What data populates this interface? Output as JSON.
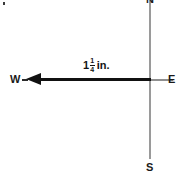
{
  "figure": {
    "width": 179,
    "height": 184,
    "background_color": "#ffffff",
    "type": "compass-vector-diagram",
    "ink_color": "#111111",
    "axis_color": "#9a9a9a"
  },
  "compass": {
    "north_label": "N",
    "south_label": "S",
    "east_label": "E",
    "west_label": "W"
  },
  "vector": {
    "direction_label": "W",
    "points_to": "west",
    "measurement": {
      "whole": "1",
      "numerator": "1",
      "denominator": "4",
      "unit": "in.",
      "full_text": "1 1/4 in."
    }
  },
  "chart_data": {
    "type": "scatter",
    "title": "",
    "xlabel": "",
    "ylabel": "",
    "annotations": [
      "1 1/4 in.",
      "N",
      "S",
      "E",
      "W"
    ],
    "axis_labels": {
      "up": "N",
      "down": "S",
      "right": "E",
      "left": "W"
    },
    "grid": false,
    "legend_position": "none",
    "series": [
      {
        "name": "displacement-vector",
        "origin": [
          150,
          80
        ],
        "tip": [
          30,
          80
        ],
        "magnitude": 1.25,
        "magnitude_unit": "in.",
        "bearing": "W"
      }
    ]
  }
}
